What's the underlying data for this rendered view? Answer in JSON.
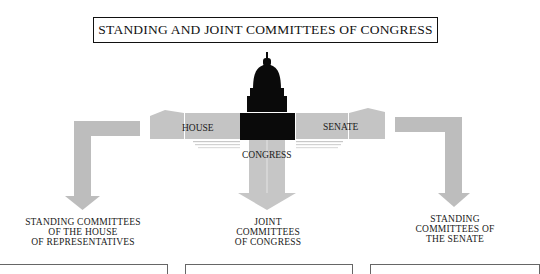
{
  "title": "STANDING AND JOINT COMMITTEES OF CONGRESS",
  "building": {
    "center_label": "CONGRESS",
    "left_wing_label": "HOUSE",
    "right_wing_label": "SENATE"
  },
  "branches": [
    {
      "id": "house",
      "lines": [
        "STANDING COMMITTEES",
        "OF THE HOUSE",
        "OF REPRESENTATIVES"
      ]
    },
    {
      "id": "joint",
      "lines": [
        "JOINT",
        "COMMITTEES",
        "OF CONGRESS"
      ]
    },
    {
      "id": "senate",
      "lines": [
        "STANDING",
        "COMMITTEES OF",
        "THE SENATE"
      ]
    }
  ],
  "colors": {
    "arrow_gray": "#bdbdbd",
    "wing_gray": "#c4c4c4",
    "dome_black": "#0a0a0a",
    "text": "#1a1a1a"
  }
}
